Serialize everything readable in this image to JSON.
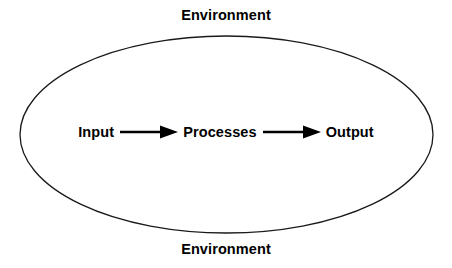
{
  "diagram": {
    "background_color": "#ffffff",
    "stroke_color": "#1a1a1a",
    "text_color": "#000000",
    "boundary": {
      "shape": "ellipse",
      "name": "system-boundary",
      "cx": 226.5,
      "cy": 134.5,
      "rx": 206.5,
      "ry": 98.5,
      "stroke_width": 1.3
    },
    "environment_top": "Environment",
    "environment_bottom": "Environment",
    "flow": {
      "nodes": [
        {
          "id": "input",
          "label": "Input"
        },
        {
          "id": "processes",
          "label": "Processes"
        },
        {
          "id": "output",
          "label": "Output"
        }
      ],
      "connectors": [
        {
          "id": "input-to-processes",
          "type": "arrow",
          "direction": "right"
        },
        {
          "id": "processes-to-output",
          "type": "arrow",
          "direction": "right"
        }
      ]
    }
  }
}
